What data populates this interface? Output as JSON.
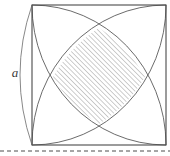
{
  "figure": {
    "labels": {
      "side_label": "a"
    },
    "colors": {
      "stroke": "#5a5a5a",
      "square_stroke": "#4a4a4a",
      "hatch": "#bdbdbd",
      "dashed_rule": "#4d4d4d",
      "label_color": "#3a3a3a",
      "background": "#ffffff"
    },
    "geometry": {
      "square": {
        "left": 32,
        "top": 5,
        "right": 166,
        "bottom": 145,
        "width": 134,
        "height": 140
      },
      "arcs": [
        {
          "name": "arc-from-top-left",
          "center": [
            32,
            5
          ],
          "radius_x": 134,
          "radius_y": 140
        },
        {
          "name": "arc-from-top-right",
          "center": [
            166,
            5
          ],
          "radius_x": 134,
          "radius_y": 140
        },
        {
          "name": "arc-from-bottom-left",
          "center": [
            32,
            145
          ],
          "radius_x": 134,
          "radius_y": 140
        },
        {
          "name": "arc-from-bottom-right",
          "center": [
            166,
            145
          ],
          "radius_x": 134,
          "radius_y": 140
        }
      ],
      "lens_vertices": {
        "top": [
          99,
          28
        ],
        "right": [
          145,
          77
        ],
        "bottom": [
          99,
          124
        ],
        "left": [
          53,
          77
        ]
      },
      "dimension_arc": {
        "name": "side-dimension-arc",
        "from": [
          32,
          5
        ],
        "to": [
          32,
          145
        ],
        "bulge_x": 8,
        "label_position": [
          15,
          77
        ]
      },
      "dashed_rule": {
        "y": 151,
        "x_start": 0,
        "x_end": 170,
        "dash": "4 3"
      }
    },
    "hatch": {
      "angle_deg": 45,
      "spacing_px": 2.4,
      "line_width": 0.9,
      "direction": "lower-left to upper-right"
    }
  }
}
